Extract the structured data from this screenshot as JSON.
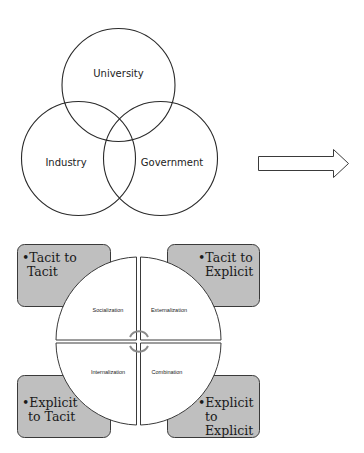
{
  "venn": {
    "circles": [
      {
        "label": "University",
        "cx": 118.5,
        "cy": 85,
        "r": 56
      },
      {
        "label": "Industry",
        "cx": 78,
        "cy": 158,
        "r": 57
      },
      {
        "label": "Government",
        "cx": 160,
        "cy": 158,
        "r": 57
      }
    ]
  },
  "arrow": {
    "direction": "right",
    "icon": "right-arrow-icon"
  },
  "seci": {
    "quadrants": {
      "top_left": "Socialization",
      "top_right": "Externalization",
      "bottom_left": "Internalization",
      "bottom_right": "Combination"
    },
    "boxes": {
      "top_left": {
        "line1": "•Tacit to",
        "line2": "Tacit"
      },
      "top_right": {
        "line1": "•Tacit to",
        "line2": "Explicit"
      },
      "bottom_left": {
        "line1": "•Explicit",
        "line2": "to Tacit"
      },
      "bottom_right": {
        "line1": "•Explicit",
        "line2": "to",
        "line3": "Explicit"
      }
    },
    "colors": {
      "box_fill": "#bfbfbf",
      "box_stroke": "#3a3a3a",
      "center_arrows": "#8a8a8a"
    }
  }
}
